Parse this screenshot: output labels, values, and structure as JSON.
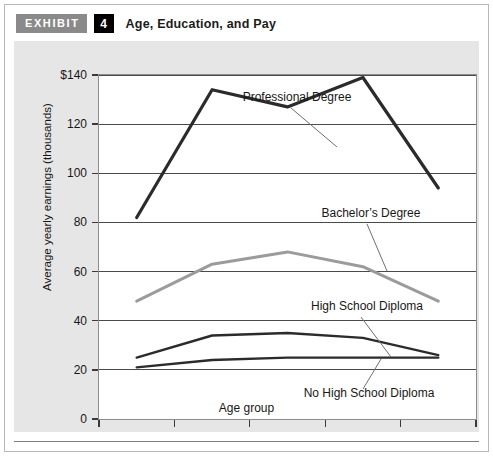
{
  "header": {
    "badge_label": "EXHIBIT",
    "badge_number": "4",
    "title": "Age, Education, and Pay"
  },
  "colors": {
    "page_background": "#ffffff",
    "panel_background": "#e6e6e6",
    "plot_background": "#ffffff",
    "badge_exhibit": "#8a8a8a",
    "badge_number": "#000000",
    "gridline": "#4a4a4a",
    "axis": "#3a3a3a",
    "series_dark": "#2b2b2b",
    "series_gray": "#9b9b9b",
    "leader_line": "#6f6f6f",
    "text": "#171717"
  },
  "chart_data": {
    "type": "line",
    "title": "Age, Education, and Pay",
    "xlabel": "Age group",
    "ylabel": "Average yearly earnings (thousands)",
    "categories": [
      "25–34",
      "35–44",
      "45–54",
      "55–64",
      "65+"
    ],
    "ylim": [
      0,
      140
    ],
    "yticks": [
      0,
      20,
      40,
      60,
      80,
      100,
      120,
      140
    ],
    "ytick_labels": [
      "0",
      "20",
      "40",
      "60",
      "80",
      "100",
      "120",
      "$140"
    ],
    "grid": true,
    "legend": "inline-annotations",
    "series": [
      {
        "name": "Professional Degree",
        "color": "#2b2b2b",
        "width": 3.2,
        "values": [
          82,
          134,
          127,
          139,
          94
        ],
        "label": "Professional Degree"
      },
      {
        "name": "Bachelor's Degree",
        "color": "#9b9b9b",
        "width": 3.0,
        "values": [
          48,
          63,
          68,
          62,
          48
        ],
        "label": "Bachelor’s Degree"
      },
      {
        "name": "High School Diploma",
        "color": "#2b2b2b",
        "width": 2.4,
        "values": [
          25,
          34,
          35,
          33,
          26
        ],
        "label": "High School Diploma"
      },
      {
        "name": "No High School Diploma",
        "color": "#2b2b2b",
        "width": 2.4,
        "values": [
          21,
          24,
          25,
          25,
          25
        ],
        "label": "No High School Diploma"
      }
    ],
    "annotations": [
      {
        "text": "Professional Degree",
        "tx": 198,
        "ty": 26,
        "lx1": 192,
        "ly1": 33,
        "lx2": 238,
        "ly2": 72
      },
      {
        "text": "Bachelor’s Degree",
        "tx": 272,
        "ty": 142,
        "lx1": 268,
        "ly1": 149,
        "lx2": 288,
        "ly2": 196
      },
      {
        "text": "High School Diploma",
        "tx": 268,
        "ty": 235,
        "lx1": 262,
        "ly1": 242,
        "lx2": 292,
        "ly2": 282
      },
      {
        "text": "No High School Diploma",
        "tx": 270,
        "ty": 322,
        "lx1": 282,
        "ly1": 284,
        "lx2": 264,
        "ly2": 314
      }
    ]
  }
}
